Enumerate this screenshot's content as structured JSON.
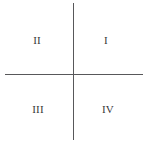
{
  "figure": {
    "background_color": "#ffffff",
    "width": 146,
    "height": 142,
    "axis_color": "#58585a",
    "label_color": "#37373a"
  },
  "axes": {
    "vertical_axis_name": "y-axis",
    "horizontal_axis_name": "x-axis"
  },
  "quadrants": [
    {
      "id": "q1",
      "label": "I"
    },
    {
      "id": "q2",
      "label": "II"
    },
    {
      "id": "q3",
      "label": "III"
    },
    {
      "id": "q4",
      "label": "IV"
    }
  ],
  "chart_data": {
    "type": "scatter",
    "title": "",
    "subtitle": "",
    "xlabel": "",
    "ylabel": "",
    "xlim": [
      -1,
      1
    ],
    "ylim": [
      -1,
      1
    ],
    "xticks": [],
    "yticks": [],
    "xticklabels": [],
    "yticklabels": [],
    "grid": false,
    "legend": false,
    "legend_position": "none",
    "series": [],
    "annotations": [
      {
        "text": "I",
        "x": 0.5,
        "y": 0.5,
        "description": "upper-right quadrant label"
      },
      {
        "text": "II",
        "x": -0.5,
        "y": 0.5,
        "description": "upper-left quadrant label"
      },
      {
        "text": "III",
        "x": -0.5,
        "y": -0.5,
        "description": "lower-left quadrant label"
      },
      {
        "text": "IV",
        "x": 0.5,
        "y": -0.5,
        "description": "lower-right quadrant label"
      }
    ]
  }
}
